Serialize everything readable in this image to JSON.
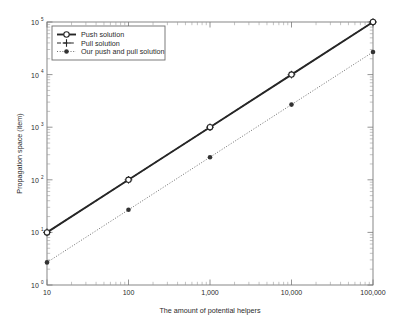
{
  "chart_data": {
    "type": "line",
    "title": "",
    "xlabel": "The amount of potential helpers",
    "ylabel": "Propagation space (item)",
    "xscale": "log",
    "yscale": "log",
    "xlim": [
      10,
      100000
    ],
    "ylim": [
      1,
      100000
    ],
    "grid": false,
    "legend_position": "upper left",
    "x": [
      10,
      100,
      1000,
      10000,
      100000
    ],
    "xtick_labels": [
      "10",
      "100",
      "1,000",
      "10,000",
      "100,000"
    ],
    "ytick_labels": [
      "10^0",
      "10^1",
      "10^2",
      "10^3",
      "10^4",
      "10^5"
    ],
    "ytick_values": [
      1,
      10,
      100,
      1000,
      10000,
      100000
    ],
    "ytick_bases": [
      "10",
      "10",
      "10",
      "10",
      "10",
      "10"
    ],
    "ytick_exponents": [
      "0",
      "1",
      "2",
      "3",
      "4",
      "5"
    ],
    "series": [
      {
        "name": "Push solution",
        "values": [
          10,
          100,
          1000,
          10000,
          100000
        ],
        "marker": "circle-open",
        "linestyle": "solid",
        "color": "#262626"
      },
      {
        "name": "Pull solution",
        "values": [
          10,
          100,
          1000,
          10000,
          100000
        ],
        "marker": "plus",
        "linestyle": "dashed",
        "color": "#262626"
      },
      {
        "name": "Our push and pull solution",
        "values": [
          5,
          50,
          500,
          5000,
          50000
        ],
        "marker": "circle-filled",
        "linestyle": "dotted",
        "color": "#555555"
      }
    ]
  },
  "legend": {
    "items": [
      {
        "label": "Push solution",
        "marker_name": "circle-open-marker-icon",
        "line_name": "solid-line-icon"
      },
      {
        "label": "Pull solution",
        "marker_name": "plus-marker-icon",
        "line_name": "dashed-line-icon"
      },
      {
        "label": "Our push and pull solution",
        "marker_name": "circle-filled-marker-icon",
        "line_name": "dotted-line-icon"
      }
    ]
  },
  "axes": {
    "x_title": "The amount of potential helpers",
    "y_title": "Propagation space (item)",
    "x_ticks": [
      "10",
      "100",
      "1,000",
      "10,000",
      "100,000"
    ],
    "y_ticks": [
      {
        "base": "10",
        "exp": "0"
      },
      {
        "base": "10",
        "exp": "1"
      },
      {
        "base": "10",
        "exp": "2"
      },
      {
        "base": "10",
        "exp": "3"
      },
      {
        "base": "10",
        "exp": "4"
      },
      {
        "base": "10",
        "exp": "5"
      }
    ]
  },
  "colors": {
    "series_dark": "#262626",
    "series_light": "#555555",
    "frame": "#7a7a7a",
    "background": "#ffffff"
  }
}
